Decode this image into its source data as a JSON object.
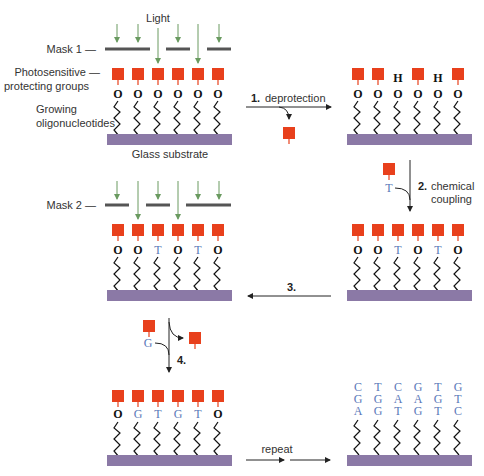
{
  "colors": {
    "protecting_group": "#e8401c",
    "substrate": "#8b79a6",
    "light_arrow": "#6a9a60",
    "base_letter": "#5a78b8",
    "mask": "#555555",
    "chain": "#111111"
  },
  "labels": {
    "light": "Light",
    "mask1": "Mask 1 —",
    "mask2": "Mask 2 —",
    "photo_line1": "Photosensitive —",
    "photo_line2": "protecting groups",
    "growing_line1": "Growing",
    "growing_line2": "oligonucleotides",
    "glass": "Glass substrate"
  },
  "steps": {
    "s1_num": "1.",
    "s1_label": "deprotection",
    "s2_num": "2.",
    "s2_label_line1": "chemical",
    "s2_label_line2": "coupling",
    "s3_num": "3.",
    "s4_num": "4.",
    "repeat": "repeat",
    "s2_reagent": "T",
    "s4_reagent": "G"
  },
  "panels": {
    "p1": [
      "O",
      "O",
      "O",
      "O",
      "O",
      "O"
    ],
    "p2_top": [
      "",
      "",
      "H",
      "",
      "H",
      ""
    ],
    "p2": [
      "O",
      "O",
      "O",
      "O",
      "O",
      "O"
    ],
    "p3": [
      "O",
      "O",
      "T",
      "O",
      "T",
      "O"
    ],
    "p4": [
      "O",
      "O",
      "T",
      "O",
      "T",
      "O"
    ],
    "p5": [
      "O",
      "G",
      "T",
      "G",
      "T",
      "O"
    ],
    "p6_row1": [
      "C",
      "T",
      "C",
      "G",
      "T",
      "G"
    ],
    "p6_row2": [
      "G",
      "G",
      "A",
      "A",
      "G",
      "T"
    ],
    "p6_row3": [
      "A",
      "G",
      "T",
      "G",
      "T",
      "C"
    ]
  }
}
